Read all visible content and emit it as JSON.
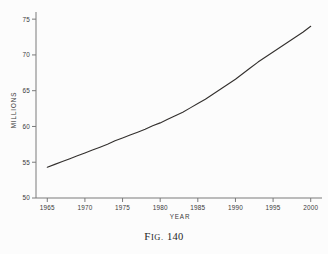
{
  "figure": {
    "caption_prefix": "F",
    "caption_smallcaps": "IG.",
    "caption_number": "140"
  },
  "chart_data": {
    "type": "line",
    "title": "",
    "xlabel": "YEAR",
    "ylabel": "MILLIONS",
    "xlim": [
      1963.5,
      2001.5
    ],
    "ylim": [
      50,
      76
    ],
    "grid": false,
    "legend": null,
    "xticks": [
      1965,
      1970,
      1975,
      1980,
      1985,
      1990,
      1995,
      2000
    ],
    "xtick_labels": [
      "1965",
      "1970",
      "1975",
      "1980",
      "1985",
      "1990",
      "1995",
      "2000"
    ],
    "yticks": [
      50,
      55,
      60,
      65,
      70,
      75
    ],
    "ytick_labels": [
      "50",
      "55",
      "60",
      "65",
      "70",
      "75"
    ],
    "series": [
      {
        "name": "Millions",
        "color": "#33302e",
        "x": [
          1965,
          1966,
          1967,
          1968,
          1969,
          1970,
          1971,
          1972,
          1973,
          1974,
          1975,
          1976,
          1977,
          1978,
          1979,
          1980,
          1981,
          1982,
          1983,
          1984,
          1985,
          1986,
          1987,
          1988,
          1989,
          1990,
          1991,
          1992,
          1993,
          1994,
          1995,
          1996,
          1997,
          1998,
          1999,
          2000
        ],
        "values": [
          54.3,
          54.7,
          55.1,
          55.5,
          55.9,
          56.3,
          56.7,
          57.1,
          57.5,
          58.0,
          58.4,
          58.8,
          59.2,
          59.6,
          60.1,
          60.5,
          61.0,
          61.5,
          62.0,
          62.6,
          63.2,
          63.8,
          64.5,
          65.2,
          65.9,
          66.6,
          67.4,
          68.2,
          69.0,
          69.7,
          70.4,
          71.1,
          71.8,
          72.5,
          73.2,
          74.0
        ]
      }
    ],
    "annotations": []
  },
  "axis_labels": {
    "x_title": "YEAR",
    "y_title": "MILLIONS"
  }
}
